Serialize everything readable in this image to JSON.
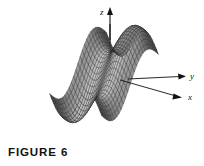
{
  "figure": {
    "caption": "FIGURE 6",
    "background_color": "#ffffff",
    "axes": {
      "z_label": "z",
      "y_label": "y",
      "x_label": "x",
      "axis_color": "#111111"
    },
    "surface": {
      "kind": "wireframe-mesh",
      "description": "3D wireframe surface plot, saddle/wave shaped",
      "mesh_line_color": "#1a1a1a",
      "fill_dark": "#4d4d4d",
      "fill_mid": "#6e6e6e",
      "fill_light": "#a8a8a8",
      "fill_highlight": "#c9c9c9"
    }
  },
  "chart_data": {
    "type": "surface",
    "title": "FIGURE 6",
    "xlabel": "x",
    "ylabel": "y",
    "zlabel": "z",
    "function": "z = sin(x) + sin(y)",
    "grid": true,
    "legend": "none",
    "xlim": [
      -3.14159,
      3.14159
    ],
    "ylim": [
      -3.14159,
      3.14159
    ],
    "zlim": [
      -2,
      2
    ],
    "nx": 26,
    "ny": 26,
    "projection": {
      "azimuth_deg": -60,
      "elevation_deg": 22
    },
    "tick_labels": {
      "x": [],
      "y": [],
      "z": []
    },
    "annotations": [
      {
        "text": "z",
        "axis": "z",
        "position": "axis-arrow-tip"
      },
      {
        "text": "y",
        "axis": "y",
        "position": "axis-arrow-tip"
      },
      {
        "text": "x",
        "axis": "x",
        "position": "axis-arrow-tip"
      }
    ]
  }
}
